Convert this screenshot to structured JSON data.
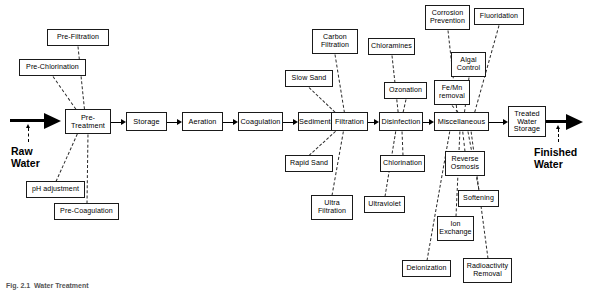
{
  "diagram": {
    "caption": "Fig. 2.1  Water Treatment",
    "inlet_label": "Raw\nWater",
    "outlet_label": "Finished\nWater",
    "line_color": "#000000",
    "box_border_color": "#1a1a1a",
    "background": "#ffffff"
  },
  "main_chain": [
    {
      "id": "pre-treatment",
      "label": "Pre-\nTreatment",
      "x": 65,
      "y": 109,
      "w": 46,
      "h": 25
    },
    {
      "id": "storage",
      "label": "Storage",
      "x": 126,
      "y": 112,
      "w": 41,
      "h": 19
    },
    {
      "id": "aeration",
      "label": "Aeration",
      "x": 182,
      "y": 112,
      "w": 41,
      "h": 19
    },
    {
      "id": "coagulation",
      "label": "Coagulation",
      "x": 238,
      "y": 112,
      "w": 45,
      "h": 19
    },
    {
      "id": "sedimentation",
      "label": "Sedimentaion",
      "x": 298,
      "y": 112,
      "w": 48,
      "h": 19
    },
    {
      "id": "filtration",
      "label": "Filtration",
      "x": 331,
      "y": 112,
      "w": 37,
      "h": 19
    },
    {
      "id": "disinfection",
      "label": "Disinfection",
      "x": 379,
      "y": 112,
      "w": 44,
      "h": 19
    },
    {
      "id": "miscellaneous",
      "label": "Miscellaneous",
      "x": 434,
      "y": 112,
      "w": 55,
      "h": 19
    },
    {
      "id": "treated-water-storage",
      "label": "Treated\nWater\nStorage",
      "x": 508,
      "y": 106,
      "w": 38,
      "h": 31
    }
  ],
  "sub_processes": [
    {
      "id": "pre-filtration",
      "label": "Pre-Filtration",
      "x": 47,
      "y": 29,
      "w": 62,
      "h": 17,
      "parent": "pre-treatment"
    },
    {
      "id": "pre-chlorination",
      "label": "Pre-Chlorination",
      "x": 19,
      "y": 59,
      "w": 67,
      "h": 17,
      "parent": "pre-treatment"
    },
    {
      "id": "ph-adjustment",
      "label": "pH adjustment",
      "x": 26,
      "y": 181,
      "w": 59,
      "h": 17,
      "parent": "pre-treatment"
    },
    {
      "id": "pre-coagulation",
      "label": "Pre-Coagulation",
      "x": 54,
      "y": 203,
      "w": 65,
      "h": 17,
      "parent": "pre-treatment"
    },
    {
      "id": "carbon-filtration",
      "label": "Carbon\nFiltration",
      "x": 312,
      "y": 29,
      "w": 46,
      "h": 25,
      "parent": "filtration"
    },
    {
      "id": "slow-sand",
      "label": "Slow Sand",
      "x": 285,
      "y": 70,
      "w": 48,
      "h": 17,
      "parent": "filtration"
    },
    {
      "id": "rapid-sand",
      "label": "Rapid Sand",
      "x": 285,
      "y": 155,
      "w": 48,
      "h": 17,
      "parent": "filtration"
    },
    {
      "id": "ultra-filtration",
      "label": "Ultra\nFiltration",
      "x": 311,
      "y": 195,
      "w": 42,
      "h": 25,
      "parent": "filtration"
    },
    {
      "id": "chloramines",
      "label": "Chloramines",
      "x": 368,
      "y": 38,
      "w": 47,
      "h": 17,
      "parent": "disinfection"
    },
    {
      "id": "ozonation",
      "label": "Ozonation",
      "x": 384,
      "y": 82,
      "w": 43,
      "h": 17,
      "parent": "disinfection"
    },
    {
      "id": "chlorination",
      "label": "Chlorination",
      "x": 380,
      "y": 155,
      "w": 45,
      "h": 17,
      "parent": "disinfection"
    },
    {
      "id": "ultraviolet",
      "label": "Ultraviolet",
      "x": 364,
      "y": 196,
      "w": 41,
      "h": 17,
      "parent": "disinfection"
    },
    {
      "id": "corrosion-prevention",
      "label": "Corrosion\nPrevention",
      "x": 425,
      "y": 5,
      "w": 45,
      "h": 25,
      "parent": "miscellaneous"
    },
    {
      "id": "fluoridation",
      "label": "Fluoridation",
      "x": 474,
      "y": 8,
      "w": 50,
      "h": 17,
      "parent": "miscellaneous"
    },
    {
      "id": "algal-control",
      "label": "Algal\nControl",
      "x": 451,
      "y": 52,
      "w": 35,
      "h": 25,
      "parent": "miscellaneous"
    },
    {
      "id": "fe-mn-removal",
      "label": "Fe/Mn\nremoval",
      "x": 434,
      "y": 80,
      "w": 36,
      "h": 25,
      "parent": "miscellaneous"
    },
    {
      "id": "reverse-osmosis",
      "label": "Reverse\nOsmosis",
      "x": 445,
      "y": 151,
      "w": 40,
      "h": 25,
      "parent": "miscellaneous"
    },
    {
      "id": "softening",
      "label": "Softening",
      "x": 458,
      "y": 190,
      "w": 41,
      "h": 17,
      "parent": "miscellaneous"
    },
    {
      "id": "ion-exchange",
      "label": "Ion\nExchange",
      "x": 437,
      "y": 216,
      "w": 37,
      "h": 25,
      "parent": "miscellaneous"
    },
    {
      "id": "deionization",
      "label": "Deionization",
      "x": 402,
      "y": 260,
      "w": 49,
      "h": 17,
      "parent": "miscellaneous"
    },
    {
      "id": "radioactivity-removal",
      "label": "Radioactivity\nRemoval",
      "x": 463,
      "y": 258,
      "w": 49,
      "h": 25,
      "parent": "miscellaneous"
    }
  ]
}
